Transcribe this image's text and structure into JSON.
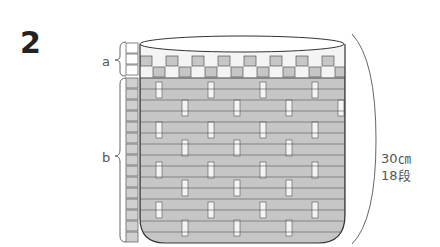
{
  "step_number": "2",
  "labels": {
    "section_a": "a",
    "section_b": "b"
  },
  "dimension": {
    "height": "30㎝",
    "rows": "18段"
  },
  "structure": {
    "rows_a": 3,
    "rows_b": 15,
    "total_rows": 18
  },
  "colors": {
    "fill_light": "#f2f2f2",
    "fill_gray": "#c8c8c8",
    "line": "#555555"
  }
}
